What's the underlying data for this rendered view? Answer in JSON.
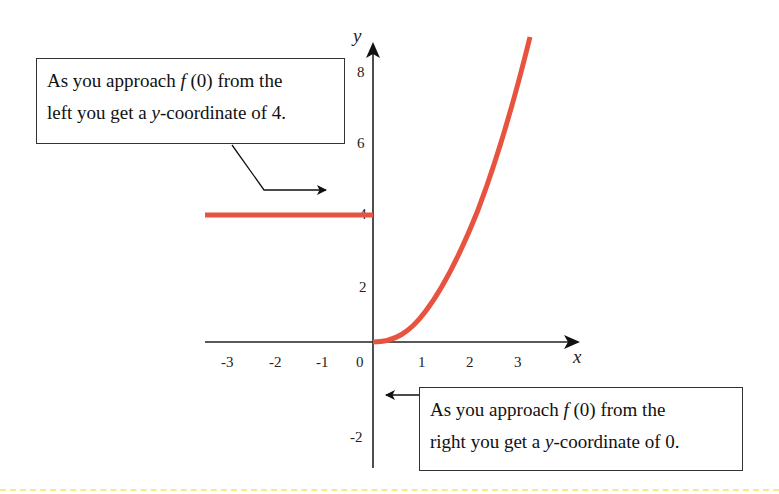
{
  "diagram": {
    "type": "piecewise-function-graph",
    "x_axis": {
      "label": "x",
      "ticks": [
        "-3",
        "-2",
        "-1",
        "0",
        "1",
        "2",
        "3"
      ]
    },
    "y_axis": {
      "label": "y",
      "ticks": [
        "8",
        "6",
        "4",
        "2",
        "-2"
      ]
    },
    "series": [
      {
        "name": "left-piece",
        "kind": "horizontal-line",
        "y": 4,
        "x_from": -3.5,
        "x_to": 0,
        "color": "#e8533f"
      },
      {
        "name": "right-piece",
        "kind": "curve",
        "approx": "y = x^2 (x >= 0)",
        "x_from": 0,
        "x_to": 3.2,
        "color": "#e8533f"
      }
    ],
    "callouts": {
      "left": {
        "line1_pre": "As you approach ",
        "fn": "f",
        "line1_post": " (0) from the",
        "line2_pre": "left you get a ",
        "var": "y",
        "line2_post": "-coordinate of 4."
      },
      "right": {
        "line1_pre": "As you approach ",
        "fn": "f",
        "line1_post": " (0) from the",
        "line2_pre": "right you get a ",
        "var": "y",
        "line2_post": "-coordinate of 0."
      }
    },
    "colors": {
      "curve": "#e8533f",
      "axis": "#222222",
      "footer_rule": "#f6e98a"
    }
  }
}
